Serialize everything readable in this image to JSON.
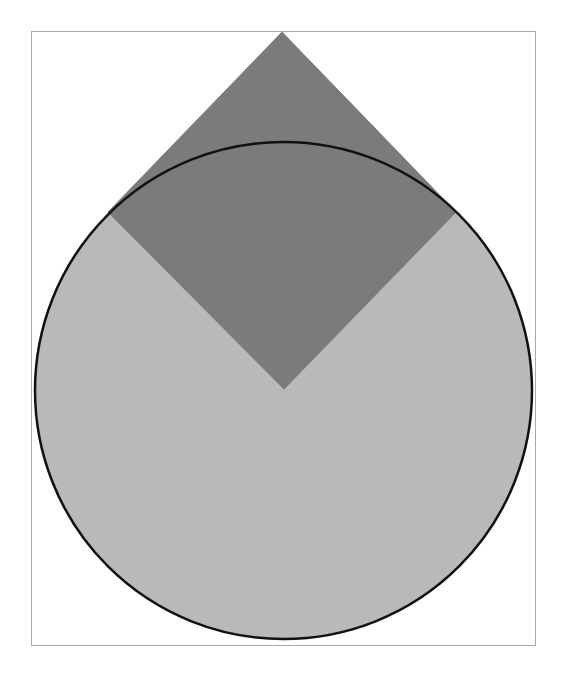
{
  "figure": {
    "canvas": {
      "width": 564,
      "height": 688,
      "background": "#ffffff"
    },
    "frame": {
      "x": 31,
      "y": 31,
      "width": 504,
      "height": 614,
      "stroke": "#a8a8a8",
      "stroke_width": 1
    },
    "circle": {
      "cx": 283.5,
      "cy": 390.5,
      "r": 248.5,
      "fill": "#b9b9b9",
      "stroke": "#111111",
      "stroke_width": 2.5
    },
    "diamond": {
      "points": [
        [
          282,
          32
        ],
        [
          456,
          212
        ],
        [
          284,
          389
        ],
        [
          108,
          212
        ]
      ],
      "fill": "#7b7b7b",
      "stroke": "#6e6e6e",
      "stroke_width": 0.8
    }
  }
}
